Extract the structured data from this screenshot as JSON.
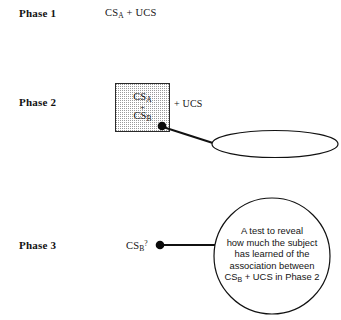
{
  "figure": {
    "background_color": "#ffffff",
    "ink_color": "#141414"
  },
  "phases": {
    "phase1": {
      "label": "Phase 1",
      "expression_prefix": "CS",
      "expression_subscript": "A",
      "expression_suffix": " + UCS"
    },
    "phase2": {
      "label": "Phase 2",
      "box": {
        "line1_prefix": "CS",
        "line1_subscript": "A",
        "operator": "+",
        "line2_prefix": "CS",
        "line2_subscript": "B",
        "fill": "stipple"
      },
      "ucs_text": "+ UCS",
      "callout_label": "Compound stimulus"
    },
    "phase3": {
      "label": "Phase 3",
      "expression_prefix": "CS",
      "expression_subscript": "B",
      "expression_suffix": "?",
      "callout_lines": [
        "A test to reveal",
        "how much the subject",
        "has learned of the",
        "association between"
      ],
      "callout_last_line_prefix": "CS",
      "callout_last_line_subscript": "B",
      "callout_last_line_suffix": " + UCS in Phase 2"
    }
  }
}
